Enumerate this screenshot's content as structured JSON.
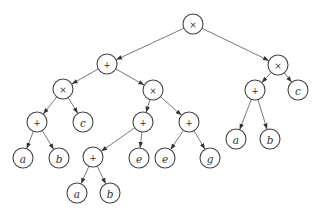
{
  "diagram": {
    "title": "",
    "type": "expression-tree",
    "expression": "((a+b)*c + ((a+b)+e)*(e+g)) * ((a+b)*c)",
    "node_radius": 10,
    "colors": {
      "stroke": "#444444",
      "edge": "#555555",
      "fill": "#ffffff",
      "text": "#333333"
    },
    "nodes": [
      {
        "id": "n0",
        "label": "×",
        "kind": "op",
        "x": 193,
        "y": 24
      },
      {
        "id": "n1",
        "label": "+",
        "kind": "op",
        "x": 107,
        "y": 64
      },
      {
        "id": "n2",
        "label": "×",
        "kind": "op",
        "x": 278,
        "y": 65
      },
      {
        "id": "n3",
        "label": "×",
        "kind": "op",
        "x": 63,
        "y": 89
      },
      {
        "id": "n4",
        "label": "×",
        "kind": "op",
        "x": 153,
        "y": 90
      },
      {
        "id": "n5",
        "label": "+",
        "kind": "op",
        "x": 255,
        "y": 90
      },
      {
        "id": "n6",
        "label": "c",
        "kind": "var",
        "x": 298,
        "y": 90
      },
      {
        "id": "n7",
        "label": "+",
        "kind": "op",
        "x": 37,
        "y": 122
      },
      {
        "id": "n8",
        "label": "c",
        "kind": "var",
        "x": 83,
        "y": 122
      },
      {
        "id": "n9",
        "label": "+",
        "kind": "op",
        "x": 143,
        "y": 122
      },
      {
        "id": "n10",
        "label": "+",
        "kind": "op",
        "x": 189,
        "y": 122
      },
      {
        "id": "n11",
        "label": "a",
        "kind": "var",
        "x": 236,
        "y": 139
      },
      {
        "id": "n12",
        "label": "b",
        "kind": "var",
        "x": 270,
        "y": 139
      },
      {
        "id": "n13",
        "label": "a",
        "kind": "var",
        "x": 23,
        "y": 158
      },
      {
        "id": "n14",
        "label": "b",
        "kind": "var",
        "x": 59,
        "y": 158
      },
      {
        "id": "n15",
        "label": "+",
        "kind": "op",
        "x": 93,
        "y": 157
      },
      {
        "id": "n16",
        "label": "e",
        "kind": "var",
        "x": 139,
        "y": 158
      },
      {
        "id": "n17",
        "label": "e",
        "kind": "var",
        "x": 165,
        "y": 158
      },
      {
        "id": "n18",
        "label": "g",
        "kind": "var",
        "x": 210,
        "y": 158
      },
      {
        "id": "n19",
        "label": "a",
        "kind": "var",
        "x": 77,
        "y": 193
      },
      {
        "id": "n20",
        "label": "b",
        "kind": "var",
        "x": 110,
        "y": 193
      }
    ],
    "edges": [
      {
        "from": "n0",
        "to": "n1"
      },
      {
        "from": "n0",
        "to": "n2"
      },
      {
        "from": "n1",
        "to": "n3"
      },
      {
        "from": "n1",
        "to": "n4"
      },
      {
        "from": "n2",
        "to": "n5"
      },
      {
        "from": "n2",
        "to": "n6"
      },
      {
        "from": "n3",
        "to": "n7"
      },
      {
        "from": "n3",
        "to": "n8"
      },
      {
        "from": "n4",
        "to": "n9"
      },
      {
        "from": "n4",
        "to": "n10"
      },
      {
        "from": "n5",
        "to": "n11"
      },
      {
        "from": "n5",
        "to": "n12"
      },
      {
        "from": "n7",
        "to": "n13"
      },
      {
        "from": "n7",
        "to": "n14"
      },
      {
        "from": "n9",
        "to": "n15"
      },
      {
        "from": "n9",
        "to": "n16"
      },
      {
        "from": "n10",
        "to": "n17"
      },
      {
        "from": "n10",
        "to": "n18"
      },
      {
        "from": "n15",
        "to": "n19"
      },
      {
        "from": "n15",
        "to": "n20"
      }
    ]
  }
}
